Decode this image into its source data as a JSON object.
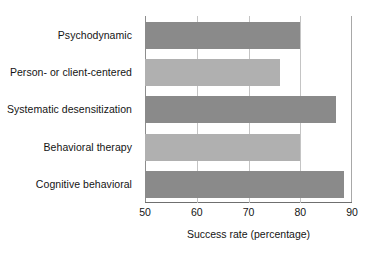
{
  "chart_data": {
    "type": "bar",
    "orientation": "horizontal",
    "title": "",
    "xlabel": "Success rate (percentage)",
    "ylabel": "",
    "xlim": [
      50,
      90
    ],
    "xticks": [
      50,
      60,
      70,
      80,
      90
    ],
    "xtick_labels": [
      "50",
      "60",
      "70",
      "80",
      "90"
    ],
    "gridlines": [
      60,
      70,
      80
    ],
    "grid": true,
    "legend": null,
    "categories": [
      "Psychodynamic",
      "Person- or client-centered",
      "Systematic desensitization",
      "Behavioral therapy",
      "Cognitive behavioral"
    ],
    "values": [
      80,
      76,
      87,
      80,
      88.5
    ],
    "bar_colors": [
      "#8a8a8a",
      "#b0b0b0",
      "#8a8a8a",
      "#b0b0b0",
      "#8a8a8a"
    ]
  },
  "colors": {
    "bar_dark": "#8a8a8a",
    "bar_light": "#b0b0b0",
    "gridline": "#c4c4c4",
    "axis": "#6f6f6f",
    "text": "#141414",
    "background": "#ffffff"
  }
}
